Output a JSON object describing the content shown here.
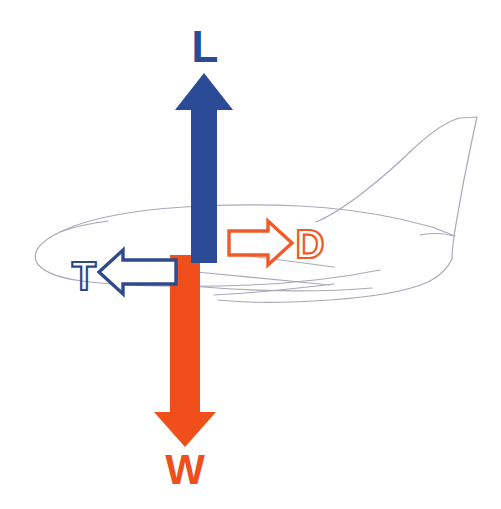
{
  "diagram": {
    "background_color": "#FFFFFF",
    "aircraft": {
      "name": "airliner-outline",
      "orientation": "nose-left-tail-right",
      "outline_color": "#A9A9B8",
      "outline_width": 1,
      "fill": "none"
    },
    "colors": {
      "lift_blue": "#2B4B96",
      "thrust_blue": "#2B4B96",
      "weight_orange": "#F04E1A",
      "drag_orange": "#F05A28",
      "aircraft_gray": "#A9A9B8"
    },
    "forces": [
      {
        "key": "lift",
        "label": "L",
        "name": "Lift",
        "direction": "up",
        "style": "filled",
        "color": "#2B4B96",
        "label_position": "above-arrow",
        "label_x": 205,
        "label_y": 62,
        "label_size": 44
      },
      {
        "key": "thrust",
        "label": "T",
        "name": "Thrust",
        "direction": "left",
        "style": "outline",
        "color": "#2B4B96",
        "label_position": "left-of-arrow",
        "label_x": 84,
        "label_y": 290,
        "label_size": 40
      },
      {
        "key": "drag",
        "label": "D",
        "name": "Drag",
        "direction": "right",
        "style": "outline",
        "color": "#F05A28",
        "label_position": "right-of-arrow",
        "label_x": 310,
        "label_y": 258,
        "label_size": 40
      },
      {
        "key": "weight",
        "label": "W",
        "name": "Weight",
        "direction": "down",
        "style": "filled",
        "color": "#F04E1A",
        "label_position": "below-arrow",
        "label_x": 185,
        "label_y": 484,
        "label_size": 42
      }
    ]
  }
}
